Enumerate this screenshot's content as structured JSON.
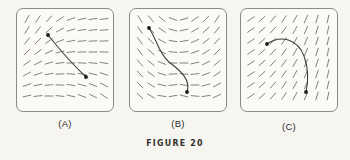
{
  "figure": {
    "caption": "FIGURE 20",
    "background_color": "#f7f5f0",
    "panel_background_color": "#fbfaf6",
    "frame_color": "#8a8a86",
    "tick_color": "#6e6c68",
    "curve_color": "#3a3a38",
    "dot_color": "#1a1a1a"
  },
  "panels": [
    {
      "id": "A",
      "label": "(A)",
      "description": "direction field with nearly horizontal slopes on the right and steep positive slopes on the upper left; solution curve is a nearly straight descending segment",
      "field": {
        "rows": 8,
        "cols": 8,
        "x0": 11,
        "y0": 11,
        "dx": 11,
        "dy": 11,
        "seg_len": 8,
        "angles_deg": [
          [
            -62,
            -57,
            -48,
            -34,
            -20,
            -12,
            -8,
            -6
          ],
          [
            -58,
            -52,
            -42,
            -28,
            -16,
            -9,
            -6,
            -4
          ],
          [
            -52,
            -45,
            -34,
            -21,
            -11,
            -6,
            -3,
            -2
          ],
          [
            -45,
            -36,
            -25,
            -14,
            -6,
            -2,
            0,
            2
          ],
          [
            -36,
            -27,
            -16,
            -7,
            -1,
            3,
            6,
            10
          ],
          [
            -27,
            -18,
            -9,
            -2,
            4,
            9,
            14,
            19
          ],
          [
            -19,
            -11,
            -4,
            2,
            9,
            15,
            21,
            27
          ],
          [
            -12,
            -6,
            0,
            6,
            13,
            20,
            27,
            33
          ]
        ]
      },
      "curve": {
        "path": "M 32 27 C 40 37, 52 52, 70 69",
        "points": [
          {
            "x": 32,
            "y": 27
          },
          {
            "x": 70,
            "y": 69
          }
        ]
      }
    },
    {
      "id": "B",
      "label": "(B)",
      "description": "saddle-shaped direction field; slopes negative on the left half and positive on the right half, flat through the middle band; solution curve is an S-shape",
      "field": {
        "rows": 8,
        "cols": 8,
        "x0": 11,
        "y0": 11,
        "dx": 11,
        "dy": 11,
        "seg_len": 8,
        "angles_deg": [
          [
            58,
            50,
            38,
            20,
            -16,
            -34,
            -46,
            -55
          ],
          [
            56,
            47,
            34,
            15,
            -13,
            -30,
            -42,
            -52
          ],
          [
            54,
            44,
            29,
            10,
            -9,
            -25,
            -38,
            -48
          ],
          [
            52,
            41,
            25,
            6,
            -5,
            -19,
            -32,
            -44
          ],
          [
            50,
            38,
            21,
            2,
            0,
            -13,
            -27,
            -40
          ],
          [
            48,
            35,
            17,
            -2,
            5,
            -7,
            -21,
            -35
          ],
          [
            46,
            32,
            13,
            -6,
            10,
            -1,
            -15,
            -30
          ],
          [
            44,
            29,
            9,
            -10,
            15,
            5,
            -9,
            -25
          ]
        ]
      },
      "curve": {
        "path": "M 20 20 C 28 32, 30 46, 40 54 C 52 63, 62 72, 58 84",
        "points": [
          {
            "x": 20,
            "y": 20
          },
          {
            "x": 58,
            "y": 84
          }
        ]
      }
    },
    {
      "id": "C",
      "label": "(C)",
      "description": "direction field whose slopes steepen from shallow positive on the left to near vertical on the right; solution curve is an arc rising then falling",
      "field": {
        "rows": 8,
        "cols": 8,
        "x0": 11,
        "y0": 11,
        "dx": 11,
        "dy": 11,
        "seg_len": 8,
        "angles_deg": [
          [
            -34,
            -41,
            -48,
            -55,
            -61,
            -67,
            -72,
            -77
          ],
          [
            -34,
            -41,
            -48,
            -55,
            -61,
            -67,
            -72,
            -77
          ],
          [
            -34,
            -41,
            -48,
            -55,
            -61,
            -67,
            -72,
            -77
          ],
          [
            -34,
            -41,
            -48,
            -55,
            -61,
            -67,
            -72,
            -77
          ],
          [
            -34,
            -41,
            -48,
            -55,
            -61,
            -67,
            -72,
            -77
          ],
          [
            -34,
            -41,
            -48,
            -55,
            -61,
            -67,
            -72,
            -77
          ],
          [
            -34,
            -41,
            -48,
            -55,
            -61,
            -67,
            -72,
            -77
          ],
          [
            -34,
            -41,
            -48,
            -55,
            -61,
            -67,
            -72,
            -77
          ]
        ]
      },
      "curve": {
        "path": "M 27 36 C 42 26, 58 32, 64 48 C 69 62, 68 75, 66 84",
        "points": [
          {
            "x": 27,
            "y": 36
          },
          {
            "x": 66,
            "y": 84
          }
        ]
      }
    }
  ]
}
